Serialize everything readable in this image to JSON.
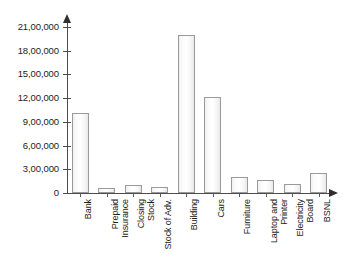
{
  "chart_data": {
    "type": "bar",
    "title": "",
    "subtitle": "",
    "xlabel": "",
    "ylabel": "",
    "ylim": [
      0,
      2100000
    ],
    "grid": false,
    "legend": null,
    "y_tick_labels": [
      "21,00,000",
      "18,00,000",
      "15,00,000",
      "12,00,000",
      "9,00,000",
      "6,00,000",
      "3,00,000",
      "0"
    ],
    "y_tick_values": [
      2100000,
      1800000,
      1500000,
      1200000,
      900000,
      600000,
      300000,
      0
    ],
    "categories": [
      "Bank",
      "Prepaid\nInsurance",
      "Closing\nStock",
      "Stock of Adv.",
      "Building",
      "Cars",
      "Furniture",
      "Laptop and\nPrinter",
      "Electricity\nBoard",
      "BSNL"
    ],
    "values": [
      1010000,
      60000,
      105000,
      80000,
      2000000,
      1210000,
      200000,
      160000,
      120000,
      250000
    ],
    "bar_fill": "#fafafa",
    "bar_border": "#9a9a9a",
    "axis_color": "#4d4d4d",
    "text_color": "#1c1c1c",
    "background": "#ffffff"
  }
}
